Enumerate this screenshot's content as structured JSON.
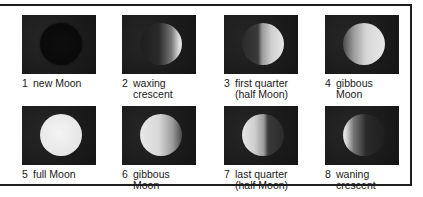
{
  "phases": [
    {
      "number": "1",
      "label": "new Moon",
      "moon_class": "m-new"
    },
    {
      "number": "2",
      "label": "waxing\ncrescent",
      "moon_class": "m-waxc"
    },
    {
      "number": "3",
      "label": "first quarter\n(half Moon)",
      "moon_class": "m-first"
    },
    {
      "number": "4",
      "label": "gibbous\nMoon",
      "moon_class": "m-gib1"
    },
    {
      "number": "5",
      "label": "full Moon",
      "moon_class": "m-full"
    },
    {
      "number": "6",
      "label": "gibbous\nMoon",
      "moon_class": "m-gib2"
    },
    {
      "number": "7",
      "label": "last quarter\n(half Moon)",
      "moon_class": "m-last"
    },
    {
      "number": "8",
      "label": "waning\ncrescent",
      "moon_class": "m-wanc"
    }
  ],
  "colors": {
    "photo_background": "#1c1c1c",
    "border": "#1e1e1e",
    "moon_lit": "#e8e8e8"
  }
}
